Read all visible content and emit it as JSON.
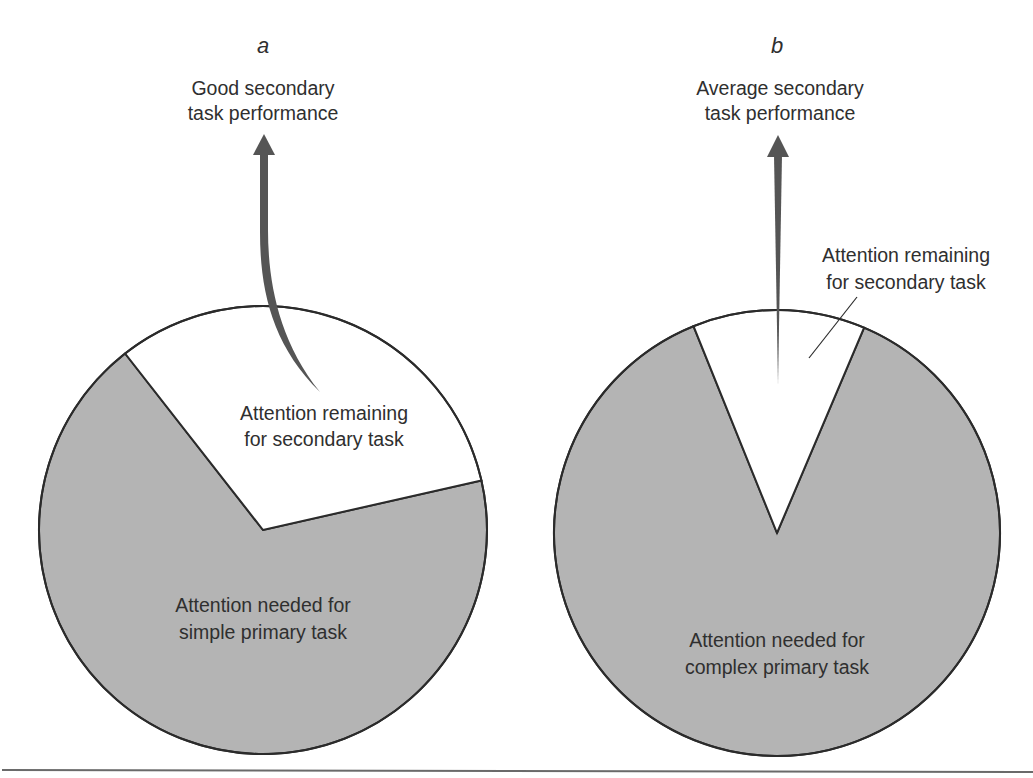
{
  "figure": {
    "panels": [
      {
        "id": "a",
        "panel_label": "a",
        "outcome_label": [
          "Good secondary",
          "task performance"
        ],
        "remaining_label": [
          "Attention remaining",
          "for secondary task"
        ],
        "needed_label": [
          "Attention needed for",
          "simple primary task"
        ],
        "remaining_fraction": 0.32,
        "remaining_start_deg": -38,
        "arrow_style": "curved"
      },
      {
        "id": "b",
        "panel_label": "b",
        "outcome_label": [
          "Average secondary",
          "task performance"
        ],
        "remaining_label": [
          "Attention remaining",
          "for secondary task"
        ],
        "needed_label": [
          "Attention needed for",
          "complex primary task"
        ],
        "remaining_fraction": 0.125,
        "remaining_start_deg": -22,
        "arrow_style": "straight"
      }
    ],
    "colors": {
      "needed_fill": "#b4b4b4",
      "remaining_fill": "#ffffff",
      "outline": "#2b2b2b",
      "arrow": "#555555",
      "rule": "#6a6a6a"
    }
  }
}
